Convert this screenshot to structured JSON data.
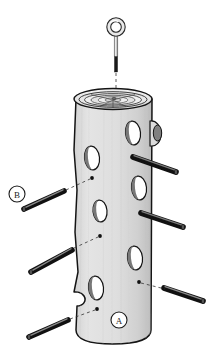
{
  "document": {
    "type": "assembly-diagram",
    "subject": "log bird feeder with eye bolt and dowel perches",
    "background_color": "#ffffff"
  },
  "colors": {
    "outline": "#1a1a1a",
    "log_body": "#dcdcdc",
    "log_body_shadow": "#c4c4c4",
    "log_top": "#ededed",
    "hole_fill": "#ffffff",
    "hole_shadow": "#6e6e6e",
    "dowel_dark": "#2f2f2f",
    "dowel_light": "#8d8d8d",
    "eyebolt_shaft": "#9a9a9a",
    "eyebolt_thread": "#1c1c1c",
    "leader_line": "#333333"
  },
  "callouts": [
    {
      "id": "A",
      "label": "A",
      "meaning": "log-body",
      "cx": 119,
      "cy": 320,
      "r": 8
    },
    {
      "id": "B",
      "label": "B",
      "meaning": "dowel-perch",
      "cx": 17,
      "cy": 194,
      "r": 8
    }
  ],
  "parts": {
    "eyebolt": {
      "name": "eye-bolt",
      "ring_cx": 116,
      "ring_cy": 27,
      "ring_r_outer": 9,
      "ring_r_inner": 5.5,
      "shaft_top": 36,
      "shaft_bottom": 72,
      "shaft_x": 116,
      "shaft_w": 3.2,
      "thread_top": 56
    },
    "log": {
      "name": "log-body",
      "top_ellipse": {
        "cx": 113,
        "cy": 99,
        "rx": 39,
        "ry": 10
      },
      "left_edge_x": 74,
      "right_edge_x": 152,
      "top_y": 99,
      "bottom_y": 344,
      "ring_count": 7
    },
    "branch_stub": {
      "cx": 155,
      "cy": 133,
      "rx": 5,
      "ry": 9
    },
    "holes": [
      {
        "cx": 133,
        "cy": 133,
        "rx": 7.5,
        "ry": 12,
        "rot": -6
      },
      {
        "cx": 92,
        "cy": 158,
        "rx": 7.5,
        "ry": 12,
        "rot": -6
      },
      {
        "cx": 139,
        "cy": 188,
        "rx": 7.5,
        "ry": 12,
        "rot": -6
      },
      {
        "cx": 100,
        "cy": 211,
        "rx": 7,
        "ry": 11,
        "rot": -6
      },
      {
        "cx": 135,
        "cy": 258,
        "rx": 7.5,
        "ry": 12,
        "rot": -6
      },
      {
        "cx": 96,
        "cy": 288,
        "rx": 7.5,
        "ry": 12,
        "rot": -6
      }
    ],
    "pilot_marks": [
      {
        "cx": 92,
        "cy": 178,
        "r": 1.8
      },
      {
        "cx": 100,
        "cy": 236,
        "r": 1.8
      },
      {
        "cx": 139,
        "cy": 282,
        "r": 1.8
      },
      {
        "cx": 97,
        "cy": 309,
        "r": 1.8
      }
    ],
    "dowels_installed": [
      {
        "name": "dowel-installed-upper-right",
        "x1": 134,
        "y1": 158,
        "x2": 176,
        "y2": 172
      },
      {
        "name": "dowel-installed-mid-right",
        "x1": 142,
        "y1": 214,
        "x2": 183,
        "y2": 227
      }
    ],
    "dowels_loose": [
      {
        "name": "dowel-loose-upper-left",
        "x1": 24,
        "y1": 208,
        "x2": 64,
        "y2": 192
      },
      {
        "name": "dowel-loose-mid-left",
        "x1": 31,
        "y1": 272,
        "x2": 72,
        "y2": 250
      },
      {
        "name": "dowel-loose-lower-left",
        "x1": 29,
        "y1": 337,
        "x2": 68,
        "y2": 320
      },
      {
        "name": "dowel-loose-right",
        "x1": 163,
        "y1": 287,
        "x2": 203,
        "y2": 300
      },
      {
        "name": "dowel-callout-b",
        "x1": 24,
        "y1": 208,
        "x2": 64,
        "y2": 192
      }
    ],
    "leader_lines": [
      {
        "name": "leader-eyebolt",
        "x1": 116,
        "y1": 74,
        "x2": 116,
        "y2": 97
      },
      {
        "name": "leader-b-to-hole",
        "x1": 68,
        "y1": 190,
        "x2": 91,
        "y2": 179
      },
      {
        "name": "leader-mid-left",
        "x1": 76,
        "y1": 248,
        "x2": 99,
        "y2": 237
      },
      {
        "name": "leader-right-lower",
        "x1": 141,
        "y1": 283,
        "x2": 164,
        "y2": 289
      },
      {
        "name": "leader-lower-left",
        "x1": 72,
        "y1": 318,
        "x2": 96,
        "y2": 310
      }
    ]
  }
}
